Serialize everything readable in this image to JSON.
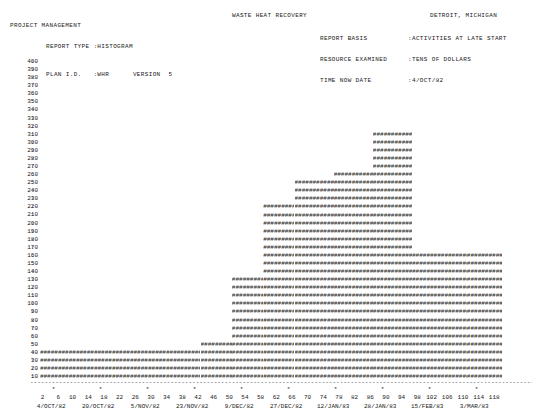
{
  "header": {
    "project_management": "PROJECT MANAGEMENT",
    "report_type_label": "REPORT TYPE :HISTOGRAM",
    "plan_id_label": "PLAN I.D.   :WHR      VERSION  5",
    "title": "WASTE HEAT RECOVERY",
    "location": "DETROIT, MICHIGAN",
    "rows": [
      {
        "label": "REPORT BASIS",
        "value": ":ACTIVITIES AT LATE START"
      },
      {
        "label": "RESOURCE EXAMINED",
        "value": ":TENS OF DOLLARS"
      },
      {
        "label": "TIME NOW DATE",
        "value": ":4/OCT/82"
      }
    ]
  },
  "chart_data": {
    "type": "bar",
    "title": "WASTE HEAT RECOVERY",
    "xlabel": "",
    "ylabel": "TENS OF DOLLARS",
    "ylim": [
      0,
      400
    ],
    "ytick_step": 10,
    "yticks": [
      400,
      390,
      380,
      370,
      360,
      350,
      340,
      330,
      320,
      310,
      300,
      290,
      280,
      270,
      260,
      250,
      240,
      230,
      220,
      210,
      200,
      190,
      180,
      170,
      160,
      150,
      140,
      130,
      120,
      110,
      100,
      90,
      80,
      70,
      60,
      50,
      40,
      30,
      20,
      10
    ],
    "xlim": [
      0,
      120
    ],
    "xtick_step": 4,
    "xticks": [
      2,
      6,
      10,
      14,
      18,
      22,
      26,
      30,
      34,
      38,
      42,
      46,
      50,
      54,
      58,
      62,
      66,
      70,
      74,
      78,
      82,
      86,
      90,
      94,
      98,
      102,
      106,
      110,
      114,
      118
    ],
    "xdate_ticks": [
      {
        "x": 4,
        "label": "4/OCT/82"
      },
      {
        "x": 16,
        "label": "20/OCT/82"
      },
      {
        "x": 28,
        "label": "5/NOV/82"
      },
      {
        "x": 40,
        "label": "23/NOV/82"
      },
      {
        "x": 52,
        "label": "9/DEC/82"
      },
      {
        "x": 64,
        "label": "27/DEC/82"
      },
      {
        "x": 76,
        "label": "12/JAN/83"
      },
      {
        "x": 88,
        "label": "28/JAN/83"
      },
      {
        "x": 100,
        "label": "15/FEB/83"
      },
      {
        "x": 112,
        "label": "3/MAR/83"
      }
    ],
    "fill_char": "#",
    "grid": false,
    "legend": null,
    "steps": [
      {
        "x_start": 1,
        "x_end": 42,
        "value": 40
      },
      {
        "x_start": 42,
        "x_end": 50,
        "value": 50
      },
      {
        "x_start": 50,
        "x_end": 58,
        "value": 130
      },
      {
        "x_start": 58,
        "x_end": 66,
        "value": 220
      },
      {
        "x_start": 66,
        "x_end": 76,
        "value": 250
      },
      {
        "x_start": 76,
        "x_end": 86,
        "value": 260
      },
      {
        "x_start": 86,
        "x_end": 96,
        "value": 310
      },
      {
        "x_start": 96,
        "x_end": 110,
        "value": 160
      },
      {
        "x_start": 110,
        "x_end": 119,
        "value": 160
      }
    ]
  }
}
